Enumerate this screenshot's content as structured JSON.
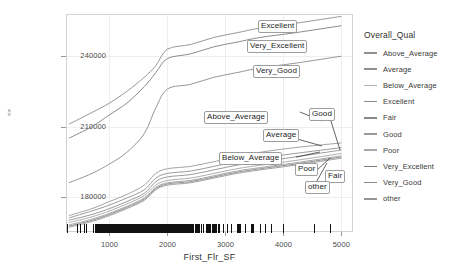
{
  "chart_data": {
    "type": "line",
    "title": "",
    "xlabel": "First_Flr_SF",
    "ylabel": "<>",
    "xlim": [
      250,
      5200
    ],
    "ylim": [
      165000,
      258000
    ],
    "xticks": [
      1000,
      2000,
      3000,
      4000,
      5000
    ],
    "yticks": [
      180000,
      210000,
      240000
    ],
    "grid": true,
    "legend_position": "right",
    "legend_title": "Overall_Qual",
    "rug": {
      "present": true,
      "description": "dense rug of First_Flr_SF observations along the bottom axis, concentrated between roughly 700 and 2000"
    },
    "series": [
      {
        "name": "Excellent",
        "color": "#8c8c8c",
        "label_position": "right",
        "x": [
          300,
          700,
          1000,
          1300,
          1600,
          1800,
          2000,
          2400,
          2800,
          3200,
          3600,
          4200,
          5000
        ],
        "y": [
          211000,
          216000,
          220000,
          225000,
          231000,
          236000,
          243000,
          245000,
          248000,
          250000,
          252000,
          254000,
          257000
        ]
      },
      {
        "name": "Very_Excellent",
        "color": "#7e7e7e",
        "label_position": "right",
        "x": [
          300,
          700,
          1000,
          1300,
          1600,
          1800,
          2000,
          2400,
          2800,
          3200,
          3600,
          4200,
          5000
        ],
        "y": [
          205000,
          210000,
          215000,
          220000,
          227000,
          233000,
          239000,
          241000,
          244000,
          246000,
          248000,
          250000,
          253000
        ]
      },
      {
        "name": "Very_Good",
        "color": "#8a8a8a",
        "label_position": "right",
        "x": [
          300,
          700,
          1000,
          1300,
          1600,
          1800,
          2000,
          2400,
          2800,
          3200,
          3600,
          4200,
          5000
        ],
        "y": [
          186000,
          190000,
          194000,
          199000,
          207000,
          218000,
          226000,
          228000,
          231000,
          233000,
          235000,
          237000,
          240000
        ]
      },
      {
        "name": "Good",
        "color": "#9a9a9a",
        "label_position": "right",
        "x": [
          300,
          700,
          1000,
          1300,
          1600,
          1800,
          2000,
          2400,
          2800,
          3200,
          3600,
          4200,
          5000
        ],
        "y": [
          172000,
          175000,
          178000,
          181000,
          185000,
          190000,
          192000,
          193000,
          195000,
          197000,
          199000,
          201000,
          203000
        ]
      },
      {
        "name": "Above_Average",
        "color": "#909090",
        "label_position": "right",
        "x": [
          300,
          700,
          1000,
          1300,
          1600,
          1800,
          2000,
          2400,
          2800,
          3200,
          3600,
          4200,
          5000
        ],
        "y": [
          171000,
          174000,
          176500,
          179500,
          183000,
          188000,
          190000,
          191000,
          193000,
          195000,
          196500,
          198500,
          201000
        ]
      },
      {
        "name": "Average",
        "color": "#8f8f8f",
        "label_position": "right",
        "x": [
          300,
          700,
          1000,
          1300,
          1600,
          1800,
          2000,
          2400,
          2800,
          3200,
          3600,
          4200,
          5000
        ],
        "y": [
          170000,
          172500,
          175000,
          178000,
          181500,
          186500,
          188500,
          189500,
          191500,
          193500,
          195000,
          197000,
          200000
        ]
      },
      {
        "name": "Below_Average",
        "color": "#a5a5a5",
        "label_position": "right",
        "x": [
          300,
          700,
          1000,
          1300,
          1600,
          1800,
          2000,
          2400,
          2800,
          3200,
          3600,
          4200,
          5000
        ],
        "y": [
          169000,
          171500,
          174000,
          177000,
          180500,
          185000,
          187000,
          188000,
          190000,
          192000,
          193500,
          195500,
          198500
        ]
      },
      {
        "name": "Poor",
        "color": "#9e9e9e",
        "label_position": "right",
        "x": [
          300,
          700,
          1000,
          1300,
          1600,
          1800,
          2000,
          2400,
          2800,
          3200,
          3600,
          4200,
          5000
        ],
        "y": [
          168000,
          170500,
          173000,
          176000,
          179500,
          184000,
          186000,
          187000,
          189000,
          191000,
          192500,
          194500,
          197500
        ]
      },
      {
        "name": "Fair",
        "color": "#888888",
        "label_position": "right",
        "x": [
          300,
          700,
          1000,
          1300,
          1600,
          1800,
          2000,
          2400,
          2800,
          3200,
          3600,
          4200,
          5000
        ],
        "y": [
          167500,
          170000,
          172500,
          175500,
          179000,
          183500,
          185500,
          186500,
          188500,
          190500,
          192000,
          194000,
          197000
        ]
      },
      {
        "name": "other",
        "color": "#959595",
        "label_position": "right",
        "x": [
          300,
          700,
          1000,
          1300,
          1600,
          1800,
          2000,
          2400,
          2800,
          3200,
          3600,
          4200,
          5000
        ],
        "y": [
          167000,
          169500,
          172000,
          175000,
          178500,
          183000,
          185000,
          186000,
          188000,
          190000,
          191500,
          193500,
          196500
        ]
      }
    ],
    "annotations": [
      {
        "text": "Excellent",
        "x_px": 258,
        "y_px": 20
      },
      {
        "text": "Very_Excellent",
        "x_px": 247,
        "y_px": 40
      },
      {
        "text": "Very_Good",
        "x_px": 253,
        "y_px": 65
      },
      {
        "text": "Above_Average",
        "x_px": 204,
        "y_px": 111
      },
      {
        "text": "Good",
        "x_px": 309,
        "y_px": 108
      },
      {
        "text": "Average",
        "x_px": 263,
        "y_px": 129
      },
      {
        "text": "Below_Average",
        "x_px": 219,
        "y_px": 152
      },
      {
        "text": "Poor",
        "x_px": 295,
        "y_px": 163
      },
      {
        "text": "Fair",
        "x_px": 325,
        "y_px": 170
      },
      {
        "text": "other",
        "x_px": 305,
        "y_px": 181
      }
    ]
  },
  "legend": {
    "title": "Overall_Qual",
    "items": [
      {
        "label": "Above_Average",
        "color": "#909090"
      },
      {
        "label": "Average",
        "color": "#8f8f8f"
      },
      {
        "label": "Below_Average",
        "color": "#b4b4b4"
      },
      {
        "label": "Excellent",
        "color": "#8c8c8c"
      },
      {
        "label": "Fair",
        "color": "#888888"
      },
      {
        "label": "Good",
        "color": "#9a9a9a"
      },
      {
        "label": "Poor",
        "color": "#a8a8a8"
      },
      {
        "label": "Very_Excellent",
        "color": "#7e7e7e"
      },
      {
        "label": "Very_Good",
        "color": "#8a8a8a"
      },
      {
        "label": "other",
        "color": "#959595"
      }
    ]
  },
  "axes": {
    "xlabel": "First_Flr_SF",
    "ylabel": "<>",
    "xticks": [
      "1000",
      "2000",
      "3000",
      "4000",
      "5000"
    ],
    "yticks": [
      "240000",
      "210000",
      "180000"
    ]
  }
}
